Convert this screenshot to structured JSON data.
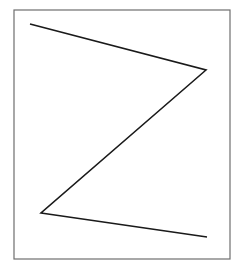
{
  "figure": {
    "background": "#ffffff",
    "frame": {
      "x": 14,
      "y": 10,
      "width": 216,
      "height": 249,
      "stroke": "#6e6e6e",
      "stroke_width": 1.2
    },
    "polyline": {
      "description": "Z-shaped zigzag line",
      "stroke": "#1a1a1a",
      "stroke_width": 1.6,
      "points": [
        {
          "x": 30,
          "y": 24
        },
        {
          "x": 206,
          "y": 70
        },
        {
          "x": 41,
          "y": 213
        },
        {
          "x": 207,
          "y": 237
        }
      ]
    }
  }
}
